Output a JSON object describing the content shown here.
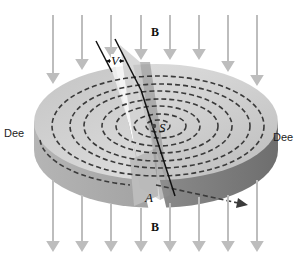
{
  "diagram": {
    "labels": {
      "field_top": "B",
      "field_bottom": "B",
      "dee_left": "Dee",
      "dee_right": "Dee",
      "voltage": "V",
      "source": "S",
      "exit_point": "A"
    },
    "colors": {
      "background": "#ffffff",
      "field_arrow": "#bdbdbd",
      "dee_top": "#cfcfcf",
      "dee_side": "#9a9a9a",
      "path_dash": "#3a3a3a",
      "gap_highlight": "#f2f2f2",
      "text": "#222222"
    },
    "field_arrows": {
      "direction": "down",
      "top_count": 8,
      "bottom_count": 8
    },
    "particle_path": {
      "style": "dashed spiral",
      "turns": 7,
      "exit_arrow": "right"
    }
  }
}
